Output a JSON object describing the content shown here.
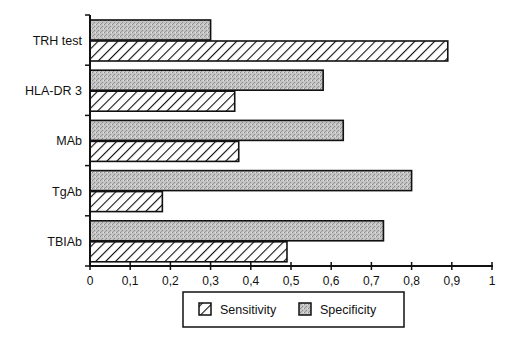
{
  "chart_data": {
    "type": "bar",
    "orientation": "horizontal",
    "title": "",
    "xlabel": "",
    "ylabel": "",
    "categories": [
      "TRH test",
      "HLA-DR 3",
      "MAb",
      "TgAb",
      "TBIAb"
    ],
    "series": [
      {
        "name": "Specificity",
        "pattern": "stipple-gray",
        "values": [
          0.3,
          0.58,
          0.63,
          0.8,
          0.73
        ]
      },
      {
        "name": "Sensitivity",
        "pattern": "diagonal-hatch",
        "values": [
          0.89,
          0.36,
          0.37,
          0.18,
          0.49
        ]
      }
    ],
    "xlim": [
      0,
      1
    ],
    "xticks": [
      0,
      0.1,
      0.2,
      0.3,
      0.4,
      0.5,
      0.6,
      0.7,
      0.8,
      0.9,
      1
    ],
    "xtick_labels": [
      "0",
      "0,1",
      "0,2",
      "0,3",
      "0,4",
      "0,5",
      "0,6",
      "0,7",
      "0,8",
      "0,9",
      "1"
    ],
    "grid": false,
    "legend": {
      "position": "bottom-center",
      "entries": [
        {
          "label": "Sensitivity",
          "pattern": "diagonal-hatch"
        },
        {
          "label": "Specificity",
          "pattern": "stipple-gray"
        }
      ]
    }
  },
  "colors": {
    "stipple_fill": "#bdbdbd",
    "stipple_dot": "#8a8a8a",
    "hatch_line": "#111111",
    "outline": "#111111"
  }
}
